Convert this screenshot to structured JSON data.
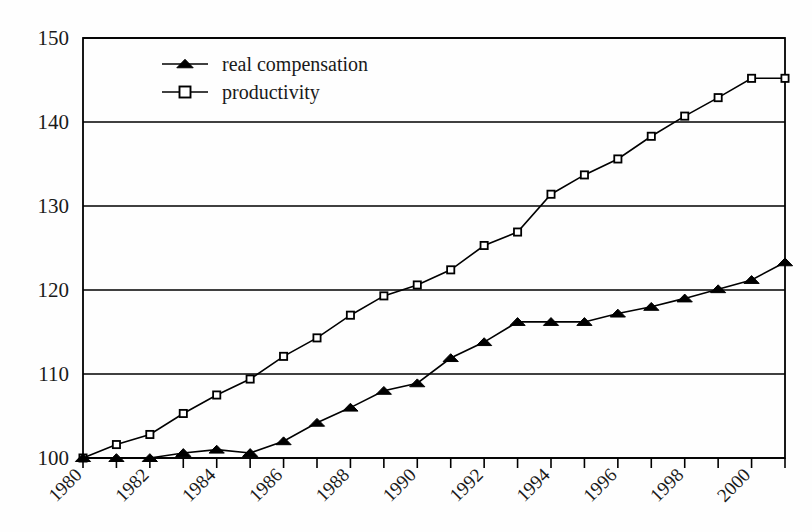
{
  "chart_data": {
    "type": "line",
    "title": "",
    "subtitle": "",
    "xlabel": "",
    "ylabel": "",
    "xlim": [
      1980,
      2001
    ],
    "ylim": [
      100,
      150
    ],
    "yticks": [
      100,
      110,
      120,
      130,
      140,
      150
    ],
    "ytick_labels": [
      "100",
      "110",
      "120",
      "130",
      "140",
      "150"
    ],
    "x": [
      1980,
      1981,
      1982,
      1983,
      1984,
      1985,
      1986,
      1987,
      1988,
      1989,
      1990,
      1991,
      1992,
      1993,
      1994,
      1995,
      1996,
      1997,
      1998,
      1999,
      2000,
      2001
    ],
    "xtick_labels": [
      "1980",
      "",
      "1982",
      "",
      "1984",
      "",
      "1986",
      "",
      "1988",
      "",
      "1990",
      "",
      "1992",
      "",
      "1994",
      "",
      "1996",
      "",
      "1998",
      "",
      "2000",
      ""
    ],
    "xtick_labels_shown": [
      "1980",
      "1982",
      "1984",
      "1986",
      "1988",
      "1990",
      "1992",
      "1994",
      "1996",
      "1998",
      "2000"
    ],
    "grid": "horizontal",
    "legend_position": "top-left-inside",
    "series": [
      {
        "name": "real compensation",
        "marker": "filled-triangle",
        "color": "#000000",
        "values": [
          100.0,
          100.0,
          100.0,
          100.6,
          101.0,
          100.6,
          102.0,
          104.2,
          106.0,
          108.0,
          108.9,
          111.9,
          113.8,
          116.2,
          116.2,
          116.2,
          117.2,
          118.0,
          119.0,
          120.1,
          121.2,
          123.3
        ]
      },
      {
        "name": "productivity",
        "marker": "open-square",
        "color": "#000000",
        "values": [
          100.0,
          101.6,
          102.8,
          105.3,
          107.5,
          109.4,
          112.1,
          114.3,
          117.0,
          119.3,
          120.6,
          122.4,
          125.3,
          126.9,
          131.4,
          133.7,
          135.6,
          138.3,
          140.7,
          142.9,
          145.2,
          145.2
        ]
      }
    ]
  },
  "legend": {
    "items": [
      {
        "label": "real compensation",
        "marker": "filled-triangle"
      },
      {
        "label": "productivity",
        "marker": "open-square"
      }
    ]
  },
  "colors": {
    "ink": "#1a1a1a",
    "line": "#000000",
    "background": "#fefefe",
    "marker_fill": "#ffffff"
  }
}
